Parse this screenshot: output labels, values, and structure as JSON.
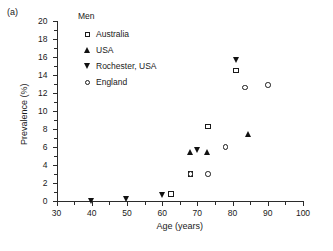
{
  "panel": {
    "label": "(a)"
  },
  "chart_data": {
    "type": "scatter",
    "title": "",
    "xlabel": "Age (years)",
    "ylabel": "Prevalence (%)",
    "xlim": [
      30,
      100
    ],
    "ylim": [
      0,
      20
    ],
    "xticks": [
      30,
      40,
      50,
      60,
      70,
      80,
      90,
      100
    ],
    "xtick_labels": [
      "30",
      "40",
      "50",
      "60",
      "70",
      "80",
      "90",
      "100"
    ],
    "xminor_step": 5,
    "yticks": [
      0,
      2,
      4,
      6,
      8,
      10,
      12,
      14,
      16,
      18,
      20
    ],
    "ytick_labels": [
      "0",
      "2",
      "4",
      "6",
      "8",
      "10",
      "12",
      "14",
      "16",
      "18",
      "20"
    ],
    "yminor_step": 1,
    "grid": false,
    "legend_position": "top-left-inside",
    "legend_title": "Men",
    "series": [
      {
        "name": "Australia",
        "marker": "open-square",
        "points": [
          {
            "x": 62.5,
            "y": 0.8
          },
          {
            "x": 68.0,
            "y": 3.0
          },
          {
            "x": 73.0,
            "y": 8.3
          },
          {
            "x": 81.0,
            "y": 14.5
          }
        ]
      },
      {
        "name": "USA",
        "marker": "filled-triangle-up",
        "points": [
          {
            "x": 68.0,
            "y": 5.5
          },
          {
            "x": 73.0,
            "y": 5.5
          },
          {
            "x": 84.5,
            "y": 7.5
          }
        ]
      },
      {
        "name": "Rochester, USA",
        "marker": "filled-triangle-down",
        "points": [
          {
            "x": 40.0,
            "y": 0.0
          },
          {
            "x": 50.0,
            "y": 0.2
          },
          {
            "x": 60.0,
            "y": 0.7
          },
          {
            "x": 70.0,
            "y": 5.7
          },
          {
            "x": 81.0,
            "y": 15.7
          }
        ]
      },
      {
        "name": "England",
        "marker": "open-circle",
        "points": [
          {
            "x": 68.0,
            "y": 3.0
          },
          {
            "x": 73.0,
            "y": 3.0
          },
          {
            "x": 78.0,
            "y": 6.0
          },
          {
            "x": 83.5,
            "y": 12.6
          },
          {
            "x": 90.0,
            "y": 12.9
          }
        ]
      }
    ]
  }
}
